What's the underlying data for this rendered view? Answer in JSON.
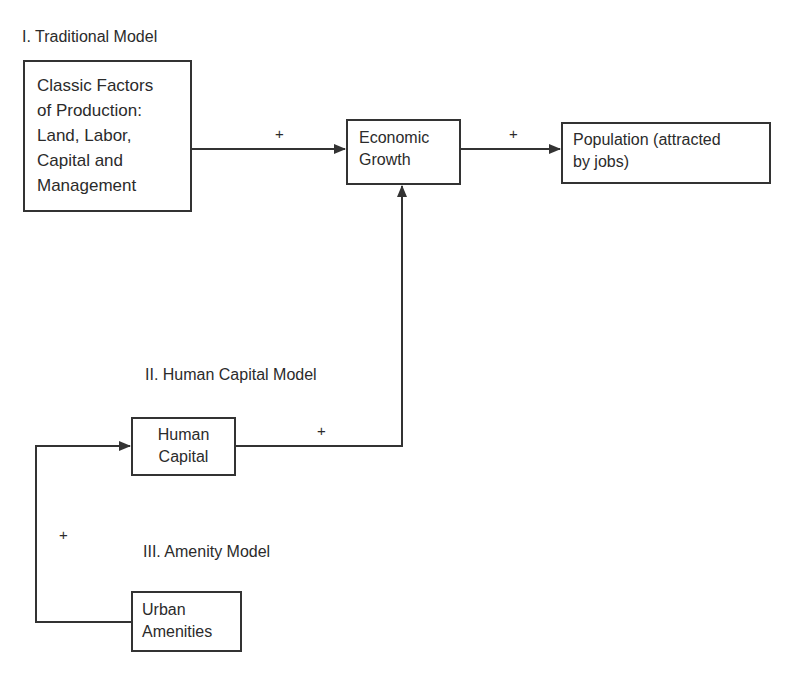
{
  "diagram": {
    "sections": {
      "traditional": "I. Traditional Model",
      "human_capital": "II. Human Capital Model",
      "amenity": "III. Amenity Model"
    },
    "nodes": {
      "classic_factors": "Classic Factors\nof Production:\nLand, Labor,\nCapital and\nManagement",
      "economic_growth": "Economic\nGrowth",
      "population": "Population (attracted\nby jobs)",
      "human_capital": "Human\nCapital",
      "urban_amenities": "Urban\nAmenities"
    },
    "edges": [
      {
        "from": "classic_factors",
        "to": "economic_growth",
        "sign": "+"
      },
      {
        "from": "economic_growth",
        "to": "population",
        "sign": "+"
      },
      {
        "from": "human_capital",
        "to": "economic_growth",
        "sign": "+"
      },
      {
        "from": "urban_amenities",
        "to": "human_capital",
        "sign": "+"
      }
    ],
    "colors": {
      "line": "#333333",
      "text": "#2b2b2b",
      "background": "#ffffff"
    }
  }
}
